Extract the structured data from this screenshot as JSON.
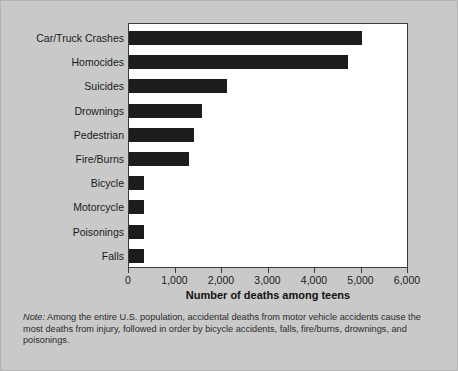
{
  "chart_data": {
    "type": "bar",
    "orientation": "horizontal",
    "title": "",
    "xlabel": "Number of deaths among teens",
    "ylabel": "",
    "xlim": [
      0,
      6000
    ],
    "xticks": [
      "0",
      "1,000",
      "2,000",
      "3,000",
      "4,000",
      "5,000",
      "6,000"
    ],
    "xtick_values": [
      0,
      1000,
      2000,
      3000,
      4000,
      5000,
      6000
    ],
    "grid": false,
    "legend": false,
    "categories": [
      "Car/Truck Crashes",
      "Homocides",
      "Suicides",
      "Drownings",
      "Pedestrian",
      "Fire/Burns",
      "Bicycle",
      "Motorcycle",
      "Poisonings",
      "Falls"
    ],
    "values": [
      5000,
      4700,
      2100,
      1570,
      1400,
      1300,
      330,
      330,
      330,
      320
    ],
    "bar_color": "#1c1c1c"
  },
  "footnote": {
    "label": "Note:",
    "text": " Among the entire U.S. population, accidental deaths from motor vehicle accidents cause the most deaths from injury, followed in order by bicycle accidents, falls, fire/burns, drownings, and poisonings."
  },
  "style": {
    "background": "#c9c9c9",
    "plot_background": "#ffffff",
    "axis_color": "#3a3a3a"
  }
}
